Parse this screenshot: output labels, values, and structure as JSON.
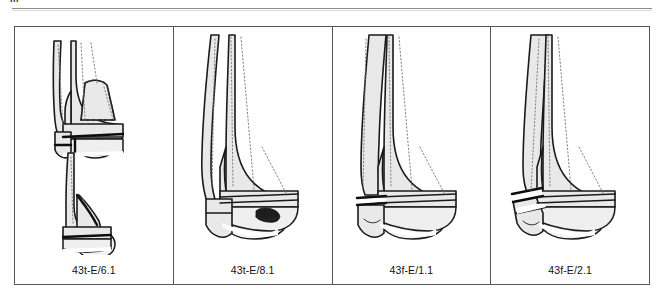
{
  "page": {
    "running_head_fragment": "III",
    "background_color": "#ffffff",
    "rule_color": "#8d8d8d"
  },
  "figure": {
    "border_color": "#55565a",
    "panel_count": 4,
    "panels": [
      {
        "id": "panel-1",
        "caption": "43t-E/6.1",
        "view_count": 2,
        "views": [
          "anteroposterior",
          "lateral"
        ],
        "description": "Distal tibia with triangular anterior articular fragment outlined by a dashed line; transverse metaphyseal fracture line; lower lateral view shows oblique malleolar fracture."
      },
      {
        "id": "panel-2",
        "caption": "43t-E/8.1",
        "view_count": 1,
        "views": [
          "anteroposterior"
        ],
        "description": "Intact tibia and fibula shafts with a dark impacted osteochondral defect in the medial distal tibial plafond."
      },
      {
        "id": "panel-3",
        "caption": "43f-E/1.1",
        "view_count": 1,
        "views": [
          "anteroposterior"
        ],
        "description": "Transverse fracture of the distal fibula at the level of the tibial plafond with an intact tibia."
      },
      {
        "id": "panel-4",
        "caption": "43f-E/2.1",
        "view_count": 1,
        "views": [
          "anteroposterior"
        ],
        "description": "Oblique wedge fracture of the distal fibula with a displaced lateral malleolar fragment; tibia intact."
      }
    ]
  },
  "colors": {
    "bone_fill": "#e9e9e9",
    "bone_outline": "#1a1a1a",
    "trabecular_stipple": "#757575",
    "fracture_line": "#0d0d0d",
    "impaction_zone": "#1d1d1d",
    "caption_text": "#111111"
  }
}
